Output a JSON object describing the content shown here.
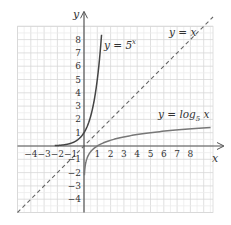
{
  "chart_data": {
    "type": "line",
    "title": "",
    "xlabel": "x",
    "ylabel": "y",
    "xlim": [
      -5,
      9.7
    ],
    "ylim": [
      -5,
      9
    ],
    "grid": true,
    "x_ticks": [
      "-4",
      "-3",
      "-2",
      "-1",
      "1",
      "2",
      "3",
      "4",
      "5",
      "6",
      "7",
      "8"
    ],
    "y_ticks": [
      "8",
      "7",
      "6",
      "5",
      "4",
      "3",
      "2",
      "1",
      "-1",
      "-2",
      "-3",
      "-4"
    ],
    "series": [
      {
        "name": "y = 5^x",
        "label_main": "y = 5",
        "label_sup": "x",
        "style": "solid",
        "color": "#444444",
        "x": [
          -3,
          -2,
          -1,
          -0.5,
          0,
          0.5,
          1,
          1.2,
          1.3
        ],
        "values": [
          0.008,
          0.04,
          0.2,
          0.447,
          1,
          2.236,
          5,
          6.9,
          8.1
        ]
      },
      {
        "name": "y = log_5 x",
        "label_main": "y = log",
        "label_sub": "5",
        "label_tail": " x",
        "style": "solid",
        "color": "#777777",
        "x": [
          0.008,
          0.04,
          0.2,
          0.447,
          1,
          2.236,
          5,
          6.9,
          9.7
        ],
        "values": [
          -3,
          -2,
          -1,
          -0.5,
          0,
          0.5,
          1,
          1.2,
          1.41
        ]
      },
      {
        "name": "y = x",
        "label_main": "y = x",
        "style": "dashed",
        "color": "#666666",
        "x": [
          -5,
          9.7
        ],
        "values": [
          -5,
          9.7
        ]
      }
    ],
    "annotations": [
      "y = 5^x",
      "y = x",
      "y = log_5 x"
    ]
  }
}
